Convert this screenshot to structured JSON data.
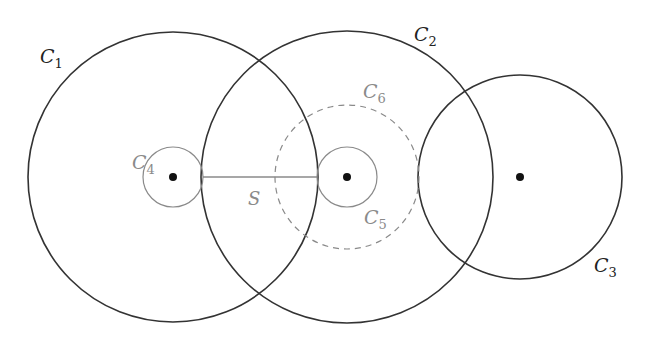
{
  "diagram": {
    "width": 653,
    "height": 340,
    "colors": {
      "dark": "#333333",
      "gray": "#8a8a8a",
      "background": "#ffffff"
    },
    "circles": [
      {
        "id": "C1",
        "name": "C",
        "sub": "1",
        "cx": 173,
        "cy": 177,
        "r": 145,
        "style": "solid-dark",
        "label_x": 40,
        "label_y": 63
      },
      {
        "id": "C2",
        "name": "C",
        "sub": "2",
        "cx": 347,
        "cy": 177,
        "r": 146,
        "style": "solid-dark",
        "label_x": 414,
        "label_y": 41
      },
      {
        "id": "C3",
        "name": "C",
        "sub": "3",
        "cx": 520,
        "cy": 177,
        "r": 102,
        "style": "solid-dark",
        "label_x": 594,
        "label_y": 272
      },
      {
        "id": "C4",
        "name": "C",
        "sub": "4",
        "cx": 173,
        "cy": 177,
        "r": 30,
        "style": "solid-gray",
        "label_x": 132,
        "label_y": 169
      },
      {
        "id": "C5",
        "name": "C",
        "sub": "5",
        "cx": 347,
        "cy": 177,
        "r": 30,
        "style": "solid-gray",
        "label_x": 364,
        "label_y": 224
      },
      {
        "id": "C6",
        "name": "C",
        "sub": "6",
        "cx": 347,
        "cy": 177,
        "r": 72,
        "style": "dashed-gray",
        "label_x": 363,
        "label_y": 98
      }
    ],
    "points": [
      {
        "id": "center-1",
        "cx": 173,
        "cy": 177,
        "r": 4
      },
      {
        "id": "center-2",
        "cx": 347,
        "cy": 177,
        "r": 4
      },
      {
        "id": "center-3",
        "cx": 520,
        "cy": 177,
        "r": 4
      }
    ],
    "segment": {
      "label": "S",
      "x1": 203,
      "y1": 177,
      "x2": 317,
      "y2": 177,
      "label_x": 248,
      "label_y": 205
    }
  }
}
